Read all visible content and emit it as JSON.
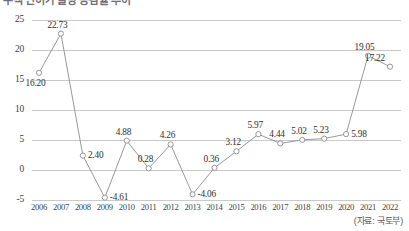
{
  "title": "주택 인허가 물량 증감률 추이",
  "source_note": "(자료: 국토부)",
  "axis": {
    "y_ticks": [
      "25",
      "20",
      "15",
      "10",
      "5",
      "0",
      "-5"
    ],
    "x_ticks": [
      "2006",
      "2007",
      "2008",
      "2009",
      "2010",
      "2011",
      "2012",
      "2013",
      "2014",
      "2015",
      "2016",
      "2017",
      "2018",
      "2019",
      "2020",
      "2021",
      "2022"
    ]
  },
  "colors": {
    "line": "#8c8c8c",
    "marker_stroke": "#8c8c8c",
    "marker_fill": "#ffffff",
    "grid": "#c9c9c9",
    "text": "#3a3a3a",
    "background": "#ffffff"
  },
  "chart_data": {
    "type": "line",
    "title": "주택 인허가 물량 증감률 추이",
    "xlabel": "",
    "ylabel": "",
    "ylim": [
      -5,
      25
    ],
    "yticks": [
      -5,
      0,
      5,
      10,
      15,
      20,
      25
    ],
    "grid": true,
    "legend": "none",
    "marker": "open-circle",
    "categories": [
      "2006",
      "2007",
      "2008",
      "2009",
      "2010",
      "2011",
      "2012",
      "2013",
      "2014",
      "2015",
      "2016",
      "2017",
      "2018",
      "2019",
      "2020",
      "2021",
      "2022"
    ],
    "values": [
      16.2,
      22.73,
      2.4,
      -4.61,
      4.88,
      0.28,
      4.26,
      -4.06,
      0.36,
      3.12,
      5.97,
      4.44,
      5.02,
      5.23,
      5.98,
      19.05,
      17.22
    ],
    "point_labels": [
      "16.20",
      "22.73",
      "2.40",
      "-4.61",
      "4.88",
      "0.28",
      "4.26",
      "-4.06",
      "0.36",
      "3.12",
      "5.97",
      "4.44",
      "5.02",
      "5.23",
      "5.98",
      "19.05",
      "17.22"
    ],
    "label_positions": [
      "below",
      "above",
      "right",
      "right",
      "above",
      "above",
      "above",
      "right",
      "above",
      "above",
      "above",
      "above",
      "above",
      "above",
      "right",
      "above",
      "above-right"
    ],
    "annotations": [
      "(자료: 국토부)"
    ]
  }
}
